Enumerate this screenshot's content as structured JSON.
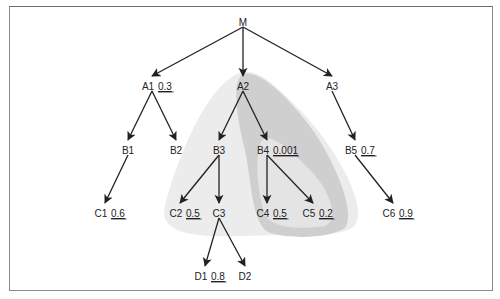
{
  "diagram": {
    "type": "tree",
    "colors": {
      "region_outer": "#ececec",
      "region_mid": "#cfcfcf",
      "region_inner": "#e4e4e4",
      "edge": "#222222",
      "frame": "#8a8a8a"
    },
    "nodes": [
      {
        "id": "M",
        "label": "M",
        "value": null,
        "x": 243,
        "y": 22
      },
      {
        "id": "A1",
        "label": "A1",
        "value": "0.3",
        "x": 152,
        "y": 86
      },
      {
        "id": "A2",
        "label": "A2",
        "value": null,
        "x": 243,
        "y": 86
      },
      {
        "id": "A3",
        "label": "A3",
        "value": null,
        "x": 332,
        "y": 86
      },
      {
        "id": "B1",
        "label": "B1",
        "value": null,
        "x": 128,
        "y": 150
      },
      {
        "id": "B2",
        "label": "B2",
        "value": null,
        "x": 176,
        "y": 150
      },
      {
        "id": "B3",
        "label": "B3",
        "value": null,
        "x": 219,
        "y": 150
      },
      {
        "id": "B4",
        "label": "B4",
        "value": "0.001",
        "x": 267,
        "y": 150
      },
      {
        "id": "B5",
        "label": "B5",
        "value": "0.7",
        "x": 355,
        "y": 150
      },
      {
        "id": "C1",
        "label": "C1",
        "value": "0.6",
        "x": 105,
        "y": 213
      },
      {
        "id": "C2",
        "label": "C2",
        "value": "0.5",
        "x": 180,
        "y": 213
      },
      {
        "id": "C3",
        "label": "C3",
        "value": null,
        "x": 219,
        "y": 213
      },
      {
        "id": "C4",
        "label": "C4",
        "value": "0.5",
        "x": 267,
        "y": 213
      },
      {
        "id": "C5",
        "label": "C5",
        "value": "0.2",
        "x": 313,
        "y": 213
      },
      {
        "id": "C6",
        "label": "C6",
        "value": "0.9",
        "x": 393,
        "y": 213
      },
      {
        "id": "D1",
        "label": "D1",
        "value": "0.8",
        "x": 205,
        "y": 276
      },
      {
        "id": "D2",
        "label": "D2",
        "value": null,
        "x": 245,
        "y": 276
      }
    ],
    "edges": [
      [
        "M",
        "A1"
      ],
      [
        "M",
        "A2"
      ],
      [
        "M",
        "A3"
      ],
      [
        "A1",
        "B1"
      ],
      [
        "A1",
        "B2"
      ],
      [
        "A2",
        "B3"
      ],
      [
        "A2",
        "B4"
      ],
      [
        "A3",
        "B5"
      ],
      [
        "B1",
        "C1"
      ],
      [
        "B3",
        "C2"
      ],
      [
        "B3",
        "C3"
      ],
      [
        "B4",
        "C4"
      ],
      [
        "B4",
        "C5"
      ],
      [
        "B5",
        "C6"
      ],
      [
        "C3",
        "D1"
      ],
      [
        "C3",
        "D2"
      ]
    ]
  }
}
